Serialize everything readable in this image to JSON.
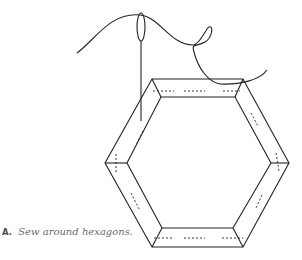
{
  "figure": {
    "label": "A.",
    "caption": "Sew around hexagons.",
    "illustration": {
      "subject": "hexagon-paper-piece-with-needle-and-thread",
      "stroke_color": "#222222",
      "fabric_border": "folded fabric edges around hexagon template",
      "stitches": "dashed basting stitches along each side"
    }
  }
}
